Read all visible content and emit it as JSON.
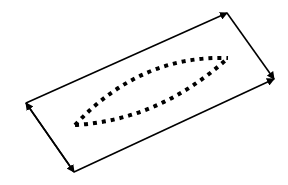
{
  "diagram": {
    "background": "#ffffff",
    "stroke_color": "#000000",
    "rectangle": {
      "corners": {
        "top_right": [
          227,
          13
        ],
        "right": [
          274,
          79
        ],
        "bottom": [
          74,
          172
        ],
        "left": [
          26,
          103
        ]
      },
      "arrowheads": [
        "top_right",
        "right",
        "bottom",
        "left"
      ]
    },
    "lens": {
      "style": "dotted-square",
      "left_tip": [
        75,
        125
      ],
      "right_tip": [
        228,
        58
      ],
      "upper_control": [
        140,
        55
      ],
      "lower_control": [
        160,
        120
      ]
    }
  }
}
